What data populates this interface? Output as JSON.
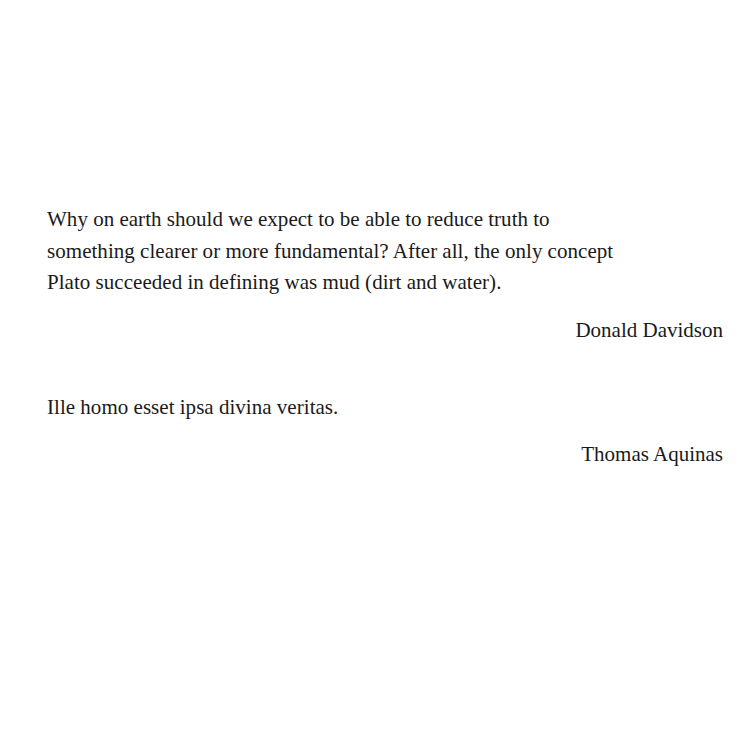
{
  "page": {
    "background_color": "#ffffff",
    "text_color": "#1a1a1a",
    "kind": "epigraph-page"
  },
  "epigraphs": [
    {
      "quote_lines": [
        "Why on earth should we expect to be able to reduce truth to",
        "something clearer or more fundamental? After all, the only concept",
        "Plato succeeded in defining was mud (dirt and water)."
      ],
      "quote_text": "Why on earth should we expect to be able to reduce truth to something clearer or more fundamental? After all, the only concept Plato succeeded in defining was mud (dirt and water).",
      "attribution": "Donald Davidson"
    },
    {
      "quote_lines": [
        "Ille homo esset ipsa divina veritas."
      ],
      "quote_text": "Ille homo esset ipsa divina veritas.",
      "attribution": "Thomas Aquinas"
    }
  ]
}
